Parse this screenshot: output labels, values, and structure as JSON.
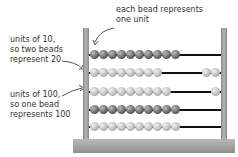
{
  "labels": {
    "top": "each bead represents\none unit",
    "tens": "units of 10,\nso two beads\nrepresent 20",
    "hundreds": "units of 100,\nso one bead\nrepresents 100"
  },
  "rows": [
    {
      "left": 10,
      "right": 0,
      "shade": "dark"
    },
    {
      "left": 8,
      "right": 2,
      "shade": "light"
    },
    {
      "left": 9,
      "right": 1,
      "shade": "light"
    },
    {
      "left": 10,
      "right": 0,
      "shade": "dark"
    },
    {
      "left": 10,
      "right": 0,
      "shade": "light"
    }
  ]
}
